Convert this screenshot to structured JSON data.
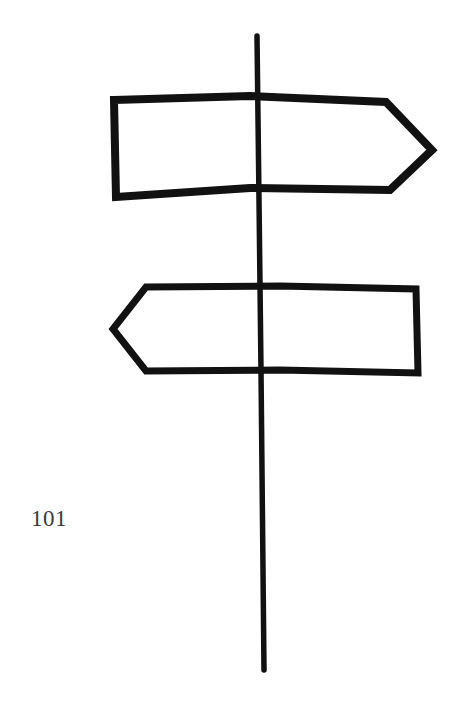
{
  "page": {
    "page_number": "101"
  },
  "illustration": {
    "subject": "signpost-icon",
    "stroke_color": "#111111",
    "background_color": "#ffffff",
    "signs": [
      {
        "name": "sign-pointing-right",
        "direction": "right"
      },
      {
        "name": "sign-pointing-left",
        "direction": "left"
      }
    ]
  }
}
